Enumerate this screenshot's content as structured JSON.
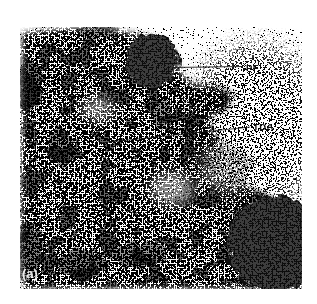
{
  "figure": {
    "panel_label": "(a)",
    "annotations": [
      {
        "id": "pf",
        "label": "PF"
      },
      {
        "id": "tda",
        "label": "TDA"
      }
    ],
    "colors": {
      "background": "#ffffff",
      "ink": "#1a1a1a",
      "label_text": "#111111",
      "panel_label_text": "#ffffff"
    }
  }
}
